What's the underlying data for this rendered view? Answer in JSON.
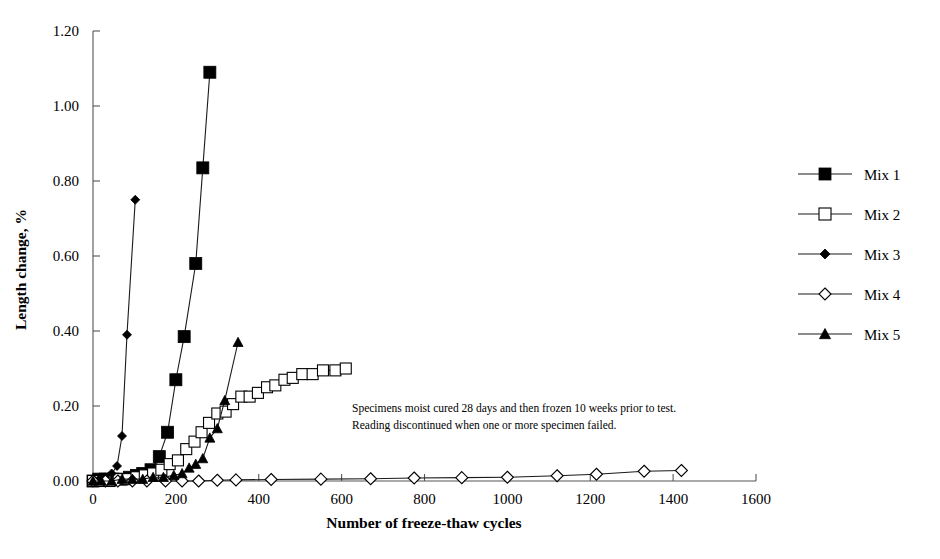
{
  "chart_data": {
    "type": "line",
    "title": "",
    "xlabel": "Number of freeze-thaw cycles",
    "ylabel": "Length change, %",
    "xlim": [
      0,
      1600
    ],
    "ylim": [
      0.0,
      1.2
    ],
    "xticks": [
      "0",
      "200",
      "400",
      "600",
      "800",
      "1000",
      "1200",
      "1400",
      "1600"
    ],
    "yticks": [
      "0.00",
      "0.20",
      "0.40",
      "0.60",
      "0.80",
      "1.00",
      "1.20"
    ],
    "grid": false,
    "legend_position": "right",
    "annotations": [
      "Specimens moist cured 28 days and then frozen 10 weeks prior to test.",
      "Reading discontinued when one or more specimen failed."
    ],
    "series": [
      {
        "name": "Mix 1",
        "marker": "filled-square",
        "color": "#000000",
        "points": [
          [
            0,
            0.0
          ],
          [
            14,
            0.005
          ],
          [
            30,
            0.005
          ],
          [
            48,
            0.005
          ],
          [
            68,
            0.005
          ],
          [
            88,
            0.01
          ],
          [
            105,
            0.015
          ],
          [
            120,
            0.02
          ],
          [
            140,
            0.03
          ],
          [
            160,
            0.065
          ],
          [
            180,
            0.13
          ],
          [
            200,
            0.27
          ],
          [
            220,
            0.385
          ],
          [
            248,
            0.58
          ],
          [
            265,
            0.835
          ],
          [
            282,
            1.09
          ]
        ]
      },
      {
        "name": "Mix 2",
        "marker": "open-square",
        "color": "#000000",
        "points": [
          [
            0,
            0.0
          ],
          [
            18,
            0.0
          ],
          [
            40,
            0.0
          ],
          [
            62,
            0.005
          ],
          [
            85,
            0.005
          ],
          [
            105,
            0.01
          ],
          [
            125,
            0.015
          ],
          [
            145,
            0.02
          ],
          [
            165,
            0.03
          ],
          [
            185,
            0.045
          ],
          [
            205,
            0.055
          ],
          [
            225,
            0.085
          ],
          [
            245,
            0.105
          ],
          [
            262,
            0.13
          ],
          [
            280,
            0.155
          ],
          [
            300,
            0.18
          ],
          [
            320,
            0.185
          ],
          [
            338,
            0.205
          ],
          [
            358,
            0.225
          ],
          [
            378,
            0.225
          ],
          [
            398,
            0.235
          ],
          [
            420,
            0.25
          ],
          [
            440,
            0.255
          ],
          [
            462,
            0.27
          ],
          [
            482,
            0.275
          ],
          [
            505,
            0.285
          ],
          [
            530,
            0.285
          ],
          [
            555,
            0.295
          ],
          [
            585,
            0.295
          ],
          [
            610,
            0.3
          ]
        ]
      },
      {
        "name": "Mix 3",
        "marker": "filled-diamond",
        "color": "#000000",
        "points": [
          [
            0,
            0.0
          ],
          [
            15,
            0.005
          ],
          [
            30,
            0.01
          ],
          [
            45,
            0.02
          ],
          [
            58,
            0.04
          ],
          [
            70,
            0.12
          ],
          [
            82,
            0.39
          ],
          [
            102,
            0.75
          ]
        ]
      },
      {
        "name": "Mix 4",
        "marker": "open-diamond",
        "color": "#000000",
        "points": [
          [
            0,
            0.0
          ],
          [
            30,
            0.0
          ],
          [
            60,
            0.0
          ],
          [
            95,
            0.0
          ],
          [
            130,
            0.0
          ],
          [
            175,
            0.0
          ],
          [
            215,
            0.0
          ],
          [
            255,
            0.0
          ],
          [
            300,
            0.002
          ],
          [
            345,
            0.003
          ],
          [
            430,
            0.004
          ],
          [
            550,
            0.005
          ],
          [
            670,
            0.006
          ],
          [
            775,
            0.008
          ],
          [
            890,
            0.009
          ],
          [
            1000,
            0.01
          ],
          [
            1120,
            0.014
          ],
          [
            1215,
            0.018
          ],
          [
            1330,
            0.026
          ],
          [
            1420,
            0.028
          ]
        ]
      },
      {
        "name": "Mix 5",
        "marker": "filled-triangle",
        "color": "#000000",
        "points": [
          [
            0,
            0.0
          ],
          [
            20,
            0.0
          ],
          [
            45,
            0.0
          ],
          [
            70,
            0.005
          ],
          [
            95,
            0.005
          ],
          [
            120,
            0.005
          ],
          [
            145,
            0.01
          ],
          [
            170,
            0.01
          ],
          [
            195,
            0.015
          ],
          [
            215,
            0.02
          ],
          [
            232,
            0.035
          ],
          [
            248,
            0.045
          ],
          [
            265,
            0.06
          ],
          [
            282,
            0.115
          ],
          [
            300,
            0.14
          ],
          [
            318,
            0.215
          ],
          [
            350,
            0.37
          ]
        ]
      }
    ]
  },
  "legend": {
    "items": [
      {
        "label": "Mix 1",
        "marker": "filled-square"
      },
      {
        "label": "Mix 2",
        "marker": "open-square"
      },
      {
        "label": "Mix 3",
        "marker": "filled-diamond"
      },
      {
        "label": "Mix 4",
        "marker": "open-diamond"
      },
      {
        "label": "Mix 5",
        "marker": "filled-triangle"
      }
    ]
  }
}
